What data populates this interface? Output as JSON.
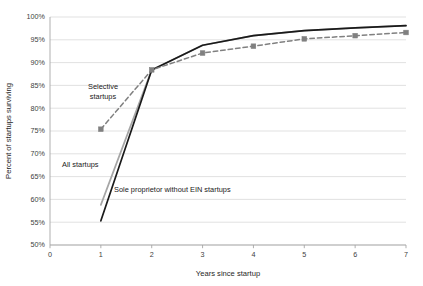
{
  "chart_data": {
    "type": "line",
    "title": "",
    "xlabel": "Years since startup",
    "ylabel": "Percent of startups surviving",
    "xlim": [
      0,
      7
    ],
    "ylim": [
      50,
      100
    ],
    "grid": true,
    "legend_position": "inline-annotations",
    "x": [
      1,
      2,
      3,
      4,
      5,
      6,
      7
    ],
    "xtick_labels": [
      "0",
      "1",
      "2",
      "3",
      "4",
      "5",
      "6",
      "7"
    ],
    "xticks": [
      0,
      1,
      2,
      3,
      4,
      5,
      6,
      7
    ],
    "ytick_labels": [
      "50%",
      "55%",
      "60%",
      "65%",
      "70%",
      "75%",
      "80%",
      "85%",
      "90%",
      "95%",
      "100%"
    ],
    "yticks": [
      50,
      55,
      60,
      65,
      70,
      75,
      80,
      85,
      90,
      95,
      100
    ],
    "series": [
      {
        "name": "Selective startups",
        "style": "dashed",
        "color": "#808080",
        "marker": "square",
        "values": [
          75.4,
          88.4,
          92.1,
          93.6,
          95.2,
          95.9,
          96.6
        ]
      },
      {
        "name": "All startups",
        "style": "solid",
        "color": "#a6a6a6",
        "marker": "none",
        "values": [
          58.8,
          88.4,
          93.8,
          95.9,
          97.0,
          97.6,
          98.1
        ]
      },
      {
        "name": "Sole proprietor without EIN startups",
        "style": "solid",
        "color": "#1a1a1a",
        "marker": "none",
        "values": [
          55.3,
          88.4,
          93.8,
          95.9,
          97.0,
          97.6,
          98.1
        ]
      }
    ],
    "annotations": [
      {
        "id": "selective",
        "text_line1": "Selective",
        "text_line2": "startups",
        "x_px": 103,
        "y_px": 89
      },
      {
        "id": "all-startups",
        "text": "All startups",
        "x_px": 62,
        "y_px": 167
      },
      {
        "id": "sole-prop",
        "text": "Sole proprietor without EIN startups",
        "x_px": 114,
        "y_px": 192
      }
    ]
  },
  "colors": {
    "plot_background": "#ffffff",
    "gridline": "#d9d9d9",
    "axis_line": "#a6a6a6",
    "tick_label": "#404040",
    "axis_title": "#262626",
    "series_selective": "#808080",
    "series_all": "#a6a6a6",
    "series_sole_prop": "#1a1a1a"
  }
}
